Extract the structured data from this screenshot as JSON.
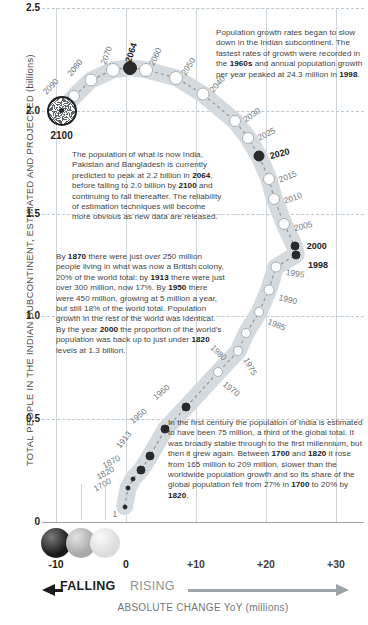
{
  "axes": {
    "y_title": "TOTAL PEOPLE IN THE INDIAN SUBCONTINENT, ESTIMATED AND PROJECTED (billions)",
    "y_ticks": [
      "2.5",
      "2.0",
      "1.5",
      "1.0",
      "0.5",
      "0"
    ],
    "x_ticks": [
      "-10",
      "0",
      "+10",
      "+20",
      "+30"
    ],
    "x_title": "ABSOLUTE CHANGE YoY (millions)",
    "falling_label": "FALLING",
    "rising_label": "RISING"
  },
  "notes": {
    "note1": "Population growth rates began to slow down in the Indian subcontinent. The fastest rates of growth were recorded in the <b>1960s</b> and annual population growth per year peaked at 24.3 million in <b>1998</b>.",
    "note2": "The population of what is now India, Pakistan and Bangladesh is currently predicted to peak at 2.2 billion in <b>2064</b>, before falling to 2.0 billion by <b>2100</b> and continuing to fall thereafter. The reliability of estimation techniques will become more obvious as new data are released.",
    "note3": "By <b>1870</b> there were just over 250 million people living in what was now a British colony, 20% of the world total: by <b>1913</b> there were just over 300 million, now 17%. By <b>1950</b> there were 450 million, growing at 5 million a year, but still 18% of the world total. Population growth in the rest of the world was identical. By the year <b>2000</b> the proportion of the world's population was back up to just under <b>1820</b> levels at 1.3 billion.",
    "note4": "In the first century the population of India is estimated to have been 75 million, a third of the global total. It was broadly stable through to the first millennium, but then it grew again. Between <b>1700</b> and <b>1820</b> it rose from 165 million to 209 million, slower than the worldwide population growth and so its share of the global population fell from 27% in <b>1700</b> to 20% by <b>1820</b>."
  },
  "marker_2100_label": "2100",
  "chart_data": {
    "type": "scatter",
    "xlabel": "ABSOLUTE CHANGE YoY (millions)",
    "ylabel": "TOTAL PEOPLE IN THE INDIAN SUBCONTINENT, ESTIMATED AND PROJECTED (billions)",
    "xlim": [
      -12,
      34
    ],
    "ylim": [
      0,
      2.5
    ],
    "grid": true,
    "legend": "none",
    "x_tick_values": [
      -10,
      0,
      10,
      20,
      30
    ],
    "y_tick_values": [
      0,
      0.5,
      1.0,
      1.5,
      2.0,
      2.5
    ],
    "points": [
      {
        "label": "1",
        "x": -0.2,
        "y": 0.075,
        "style": "tiny"
      },
      {
        "label": "1700",
        "x": 0.3,
        "y": 0.165,
        "style": "tiny"
      },
      {
        "label": "1820",
        "x": 1.0,
        "y": 0.209,
        "style": "tiny"
      },
      {
        "label": "1870",
        "x": 2.2,
        "y": 0.255,
        "style": "fill"
      },
      {
        "label": "1913",
        "x": 3.4,
        "y": 0.32,
        "style": "fill"
      },
      {
        "label": "1950",
        "x": 5.6,
        "y": 0.45,
        "style": "fill"
      },
      {
        "label": "1960",
        "x": 8.6,
        "y": 0.56,
        "style": "fill"
      },
      {
        "label": "1970",
        "x": 13.2,
        "y": 0.73,
        "style": "open"
      },
      {
        "label": "1975",
        "x": 16.0,
        "y": 0.83,
        "style": "open"
      },
      {
        "label": "1980",
        "x": 17.2,
        "y": 0.92,
        "style": "open"
      },
      {
        "label": "1985",
        "x": 19.0,
        "y": 1.02,
        "style": "open"
      },
      {
        "label": "1990",
        "x": 20.4,
        "y": 1.13,
        "style": "open"
      },
      {
        "label": "1995",
        "x": 21.4,
        "y": 1.24,
        "style": "open"
      },
      {
        "label": "1998",
        "x": 24.3,
        "y": 1.3,
        "style": "fill"
      },
      {
        "label": "2000",
        "x": 24.1,
        "y": 1.34,
        "style": "fill"
      },
      {
        "label": "2005",
        "x": 22.6,
        "y": 1.45,
        "style": "open"
      },
      {
        "label": "2010",
        "x": 21.2,
        "y": 1.57,
        "style": "open"
      },
      {
        "label": "2015",
        "x": 20.4,
        "y": 1.67,
        "style": "open"
      },
      {
        "label": "2020",
        "x": 19.0,
        "y": 1.78,
        "style": "fill"
      },
      {
        "label": "2025",
        "x": 17.4,
        "y": 1.87,
        "style": "open"
      },
      {
        "label": "2030",
        "x": 15.6,
        "y": 1.95,
        "style": "open"
      },
      {
        "label": "2040",
        "x": 11.0,
        "y": 2.08,
        "style": "open"
      },
      {
        "label": "2050",
        "x": 7.2,
        "y": 2.16,
        "style": "open"
      },
      {
        "label": "2060",
        "x": 2.8,
        "y": 2.2,
        "style": "open"
      },
      {
        "label": "2064",
        "x": 0.6,
        "y": 2.21,
        "style": "fill"
      },
      {
        "label": "2070",
        "x": -1.8,
        "y": 2.2,
        "style": "open"
      },
      {
        "label": "2080",
        "x": -5.0,
        "y": 2.15,
        "style": "open"
      },
      {
        "label": "2090",
        "x": -7.4,
        "y": 2.07,
        "style": "open"
      },
      {
        "label": "2100",
        "x": -9.2,
        "y": 2.0,
        "style": "burst"
      }
    ]
  }
}
